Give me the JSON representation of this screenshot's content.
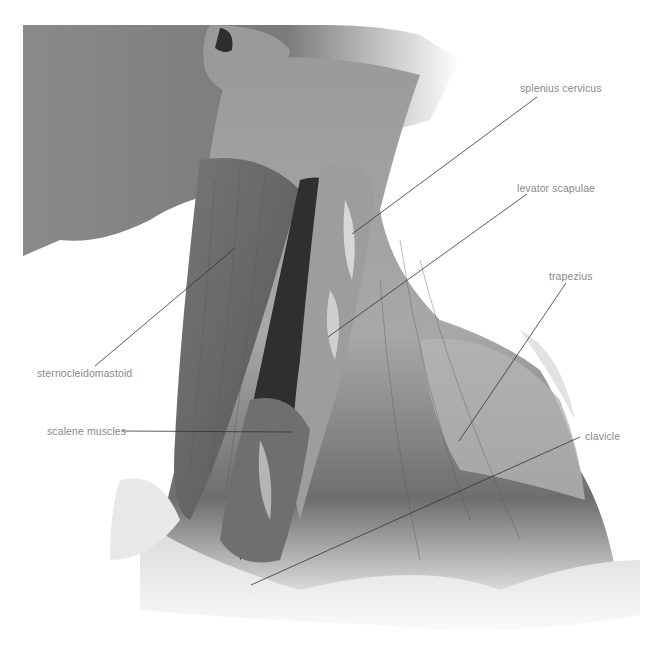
{
  "figure": {
    "colors": {
      "background": "#ffffff",
      "skin": "#7b7b7b",
      "muscle_dark": "#3a3a3a",
      "muscle_mid": "#8c8c8c",
      "muscle_light": "#cfcfcf",
      "label_text": "#8a8a8a",
      "leader_line": "#333333"
    }
  },
  "labels": [
    {
      "id": "splenius",
      "text": "splenius cervicus",
      "x": 520,
      "y": 82,
      "line": [
        537,
        97,
        352,
        234
      ]
    },
    {
      "id": "levator",
      "text": "levator scapulae",
      "x": 517,
      "y": 182,
      "line": [
        527,
        194,
        328,
        337
      ]
    },
    {
      "id": "trapezius",
      "text": "trapezius",
      "x": 549,
      "y": 270,
      "line": [
        566,
        283,
        459,
        441
      ]
    },
    {
      "id": "scm",
      "text": "sternocleidomastoid",
      "x": 37,
      "y": 367,
      "line": [
        95,
        366,
        235,
        248
      ]
    },
    {
      "id": "scalene",
      "text": "scalene muscles",
      "x": 47,
      "y": 425,
      "line": [
        122,
        431,
        292,
        432
      ]
    },
    {
      "id": "clavicle",
      "text": "clavicle",
      "x": 585,
      "y": 430,
      "line": [
        580,
        437,
        251,
        585
      ]
    }
  ]
}
